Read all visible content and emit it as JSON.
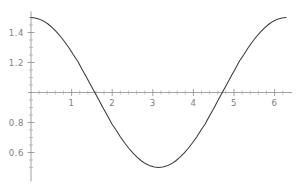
{
  "chart_data": {
    "type": "line",
    "title": "",
    "subtitle": "",
    "xlabel": "",
    "ylabel": "",
    "xlim": [
      0,
      6.283185
    ],
    "ylim": [
      0.5,
      1.5
    ],
    "grid": false,
    "legend": null,
    "function": "1 + 0.5*cos(x)",
    "x_ticks_major": [
      1,
      2,
      3,
      4,
      5,
      6
    ],
    "x_tick_labels": [
      "1",
      "2",
      "3",
      "4",
      "5",
      "6"
    ],
    "y_ticks_major": [
      0.6,
      0.8,
      1.2,
      1.4
    ],
    "y_tick_labels": [
      "0.6",
      "0.8",
      "1.2",
      "1.4"
    ],
    "x_minor_step": 0.2,
    "y_minor_step": 0.05,
    "x_axis_at_y": 1.0,
    "y_axis_at_x": 0.0,
    "series": [
      {
        "name": "1 + 0.5 cos(x)",
        "color": "#3a3a3a",
        "x": [
          0.0,
          0.1047,
          0.2094,
          0.3142,
          0.4189,
          0.5236,
          0.6283,
          0.733,
          0.8378,
          0.9425,
          1.0472,
          1.1519,
          1.2566,
          1.3614,
          1.4661,
          1.5708,
          1.6755,
          1.7802,
          1.885,
          1.9897,
          2.0944,
          2.1991,
          2.3038,
          2.4086,
          2.5133,
          2.618,
          2.7227,
          2.8274,
          2.9322,
          3.0369,
          3.1416,
          3.2463,
          3.351,
          3.4558,
          3.5605,
          3.6652,
          3.7699,
          3.8746,
          3.9794,
          4.0841,
          4.1888,
          4.2935,
          4.3982,
          4.5029,
          4.6077,
          4.7124,
          4.8171,
          4.9218,
          5.0265,
          5.1313,
          5.236,
          5.3407,
          5.4454,
          5.5501,
          5.6549,
          5.7596,
          5.8643,
          5.969,
          6.0737,
          6.1785,
          6.2832
        ],
        "y": [
          1.5,
          1.4973,
          1.4891,
          1.4755,
          1.4568,
          1.433,
          1.4045,
          1.3717,
          1.335,
          1.2949,
          1.25,
          1.2079,
          1.1545,
          1.1045,
          1.0523,
          1.0,
          0.9477,
          0.8955,
          0.8455,
          0.7921,
          0.75,
          0.7051,
          0.665,
          0.6283,
          0.5955,
          0.567,
          0.5432,
          0.5245,
          0.5109,
          0.5027,
          0.5,
          0.5027,
          0.5109,
          0.5245,
          0.5432,
          0.567,
          0.5955,
          0.6283,
          0.665,
          0.7051,
          0.75,
          0.7921,
          0.8455,
          0.8955,
          0.9477,
          1.0,
          1.0523,
          1.1045,
          1.1545,
          1.2079,
          1.25,
          1.2949,
          1.335,
          1.3717,
          1.4045,
          1.433,
          1.4568,
          1.4755,
          1.4891,
          1.4973,
          1.5
        ]
      }
    ],
    "annotations": []
  },
  "plot": {
    "axis_color": "#8c8c8c",
    "curve_color": "#3a3a3a",
    "label_color": "#808080",
    "background": "#ffffff"
  }
}
